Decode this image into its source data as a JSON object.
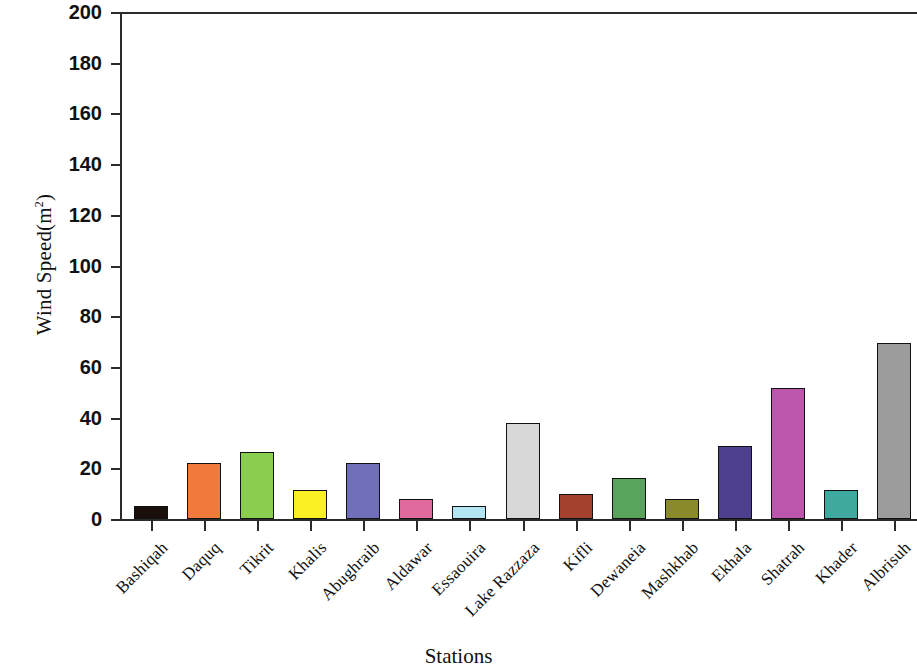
{
  "chart_data": {
    "type": "bar",
    "title": "",
    "xlabel": "Stations",
    "ylabel": "Wind Speed(m",
    "ylabel_sup": "2",
    "ylabel_tail": ")",
    "ylim": [
      0,
      200
    ],
    "ytick_step": 20,
    "grid": false,
    "legend": "none",
    "categories": [
      "Bashiqah",
      "Daquq",
      "Tikrit",
      "Khalis",
      "Abughraib",
      "Aldawar",
      "Essaouira",
      "Lake Razzaza",
      "Kifli",
      "Dewaneia",
      "Mashkhab",
      "Ekhala",
      "Shatrah",
      "Khader",
      "Albrisuh"
    ],
    "values": [
      5,
      22,
      26.5,
      11.5,
      22,
      8,
      5,
      38,
      10,
      16,
      8,
      29,
      51.5,
      11.5,
      69.5
    ],
    "yticks": [
      "0",
      "20",
      "40",
      "60",
      "80",
      "100",
      "120",
      "140",
      "160",
      "180",
      "200"
    ],
    "colors": [
      "#1b0f0c",
      "#f07a3c",
      "#8ace4f",
      "#faf024",
      "#6f6fba",
      "#e06a9b",
      "#b3e6f2",
      "#d8d8d8",
      "#a4402e",
      "#59a35c",
      "#8a8a2a",
      "#4e3f8f",
      "#bc55ac",
      "#3fa9a0",
      "#9c9c9c"
    ],
    "bar_edge_color": "#111111",
    "axis_color": "#2b2b2b"
  }
}
